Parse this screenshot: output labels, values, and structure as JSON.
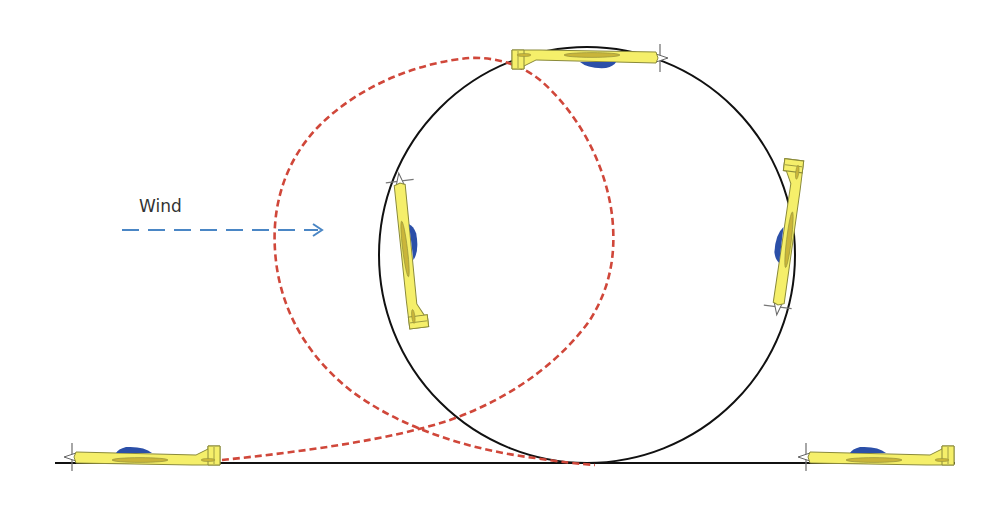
{
  "diagram": {
    "wind_label": "Wind",
    "colors": {
      "background": "#ffffff",
      "ideal_path": "#111111",
      "wind_drift_path": "#d0473a",
      "wind_arrow": "#4a86c5",
      "plane_body": "#f5ef6a",
      "plane_outline": "#8a8a3a",
      "canopy": "#2b4fa8",
      "wing_detail": "#c9b53a",
      "ground_line": "#111111"
    },
    "elements": {
      "ground_line": {
        "x1": 55,
        "x2": 955,
        "y": 463
      },
      "ideal_loop_circle": {
        "cx": 587,
        "cy": 255,
        "r": 208
      },
      "wind_arrow": {
        "x1": 122,
        "x2": 322,
        "y": 230,
        "direction": "right"
      },
      "planes": [
        {
          "id": "entry",
          "position": "bottom-left",
          "heading": "right"
        },
        {
          "id": "top",
          "position": "top",
          "heading": "left",
          "inverted": true
        },
        {
          "id": "left-side",
          "position": "left",
          "heading": "down"
        },
        {
          "id": "right-side",
          "position": "right",
          "heading": "up"
        },
        {
          "id": "exit",
          "position": "bottom-right",
          "heading": "right"
        }
      ]
    }
  }
}
